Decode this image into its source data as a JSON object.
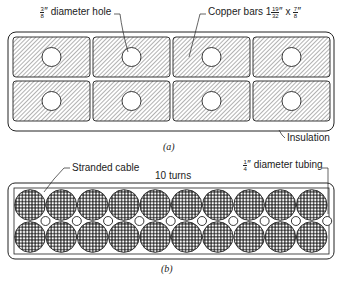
{
  "figure_a": {
    "caption": "(a)",
    "labels": {
      "hole_frac_num": "3",
      "hole_frac_den": "8",
      "hole_text": "″ diameter hole",
      "copper_text": "Copper bars 1",
      "copper_frac1_num": "19",
      "copper_frac1_den": "32",
      "copper_times": "″ x ",
      "copper_frac2_num": "7",
      "copper_frac2_den": "8",
      "copper_inch": "″",
      "insulation": "Insulation"
    },
    "grid": {
      "rows": 2,
      "cols": 4
    }
  },
  "figure_b": {
    "caption": "(b)",
    "labels": {
      "stranded": "Stranded cable",
      "turns": "10 turns",
      "tube_frac_num": "1",
      "tube_frac_den": "4",
      "tube_text": "″ diameter tubing"
    },
    "cables_per_row": 10,
    "rows": 2,
    "tubes": 10
  },
  "colors": {
    "line": "#222222",
    "hatch": "#555555",
    "background": "#ffffff"
  }
}
